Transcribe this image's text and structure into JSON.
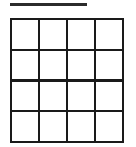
{
  "figure": {
    "title_rule": {
      "name": "top-horizontal-rule",
      "label": "",
      "color": "#2b2b2b",
      "thickness_px": 2.5,
      "x_start_px": 10,
      "x_end_px": 87,
      "y_px": 3
    },
    "background_color": "#ffffff",
    "grid": {
      "name": "four-by-four-grid",
      "rows": 4,
      "columns": 4,
      "cell_count": 16,
      "line_color": "#1a1a1a",
      "line_thickness_px": 2.4,
      "cell_fill_color": "#ffffff",
      "bounds_px": {
        "left": 10,
        "top": 18,
        "right": 124,
        "bottom": 143
      },
      "cells": [
        {
          "row": 1,
          "col": 1,
          "label": ""
        },
        {
          "row": 1,
          "col": 2,
          "label": ""
        },
        {
          "row": 1,
          "col": 3,
          "label": ""
        },
        {
          "row": 1,
          "col": 4,
          "label": ""
        },
        {
          "row": 2,
          "col": 1,
          "label": ""
        },
        {
          "row": 2,
          "col": 2,
          "label": ""
        },
        {
          "row": 2,
          "col": 3,
          "label": ""
        },
        {
          "row": 2,
          "col": 4,
          "label": ""
        },
        {
          "row": 3,
          "col": 1,
          "label": ""
        },
        {
          "row": 3,
          "col": 2,
          "label": ""
        },
        {
          "row": 3,
          "col": 3,
          "label": ""
        },
        {
          "row": 3,
          "col": 4,
          "label": ""
        },
        {
          "row": 4,
          "col": 1,
          "label": ""
        },
        {
          "row": 4,
          "col": 2,
          "label": ""
        },
        {
          "row": 4,
          "col": 3,
          "label": ""
        },
        {
          "row": 4,
          "col": 4,
          "label": ""
        }
      ]
    }
  }
}
